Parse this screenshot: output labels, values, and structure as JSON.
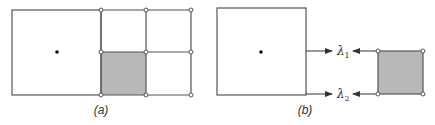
{
  "figure": {
    "panel_a": {
      "caption": "(a)",
      "description": "Large cell with center point adjacent to finer grid of 2x2 cells; lower-left fine cell shaded"
    },
    "panel_b": {
      "caption": "(b)",
      "labels": {
        "lambda1": "λ",
        "lambda1_sub": "1",
        "lambda2": "λ",
        "lambda2_sub": "2"
      },
      "description": "Large cell edges and shaded fine cell mapped to interface quantities λ1 and λ2"
    },
    "colors": {
      "line": "#555555",
      "shade": "#b8b8b8",
      "node_fill": "#ffffff",
      "dot": "#111111"
    }
  }
}
